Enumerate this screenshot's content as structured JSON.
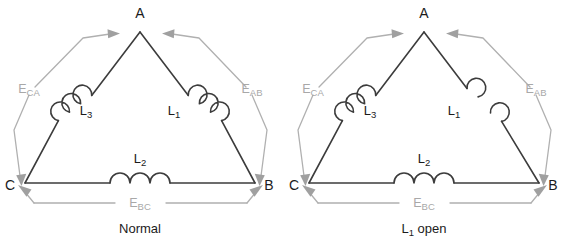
{
  "figure": {
    "background_color": "#ffffff",
    "line_color": "#3c3c3c",
    "annotation_color": "#a8a8a8",
    "text_color": "#1b1b1b"
  },
  "panels": [
    {
      "id": "normal",
      "caption": "Normal",
      "caption_sub": "",
      "caption_tail": "",
      "vertices": {
        "a": "A",
        "b": "B",
        "c": "C"
      },
      "coils": [
        {
          "name": "L",
          "sub": "1",
          "position": "right-leg",
          "state": "closed",
          "turns": 3
        },
        {
          "name": "L",
          "sub": "2",
          "position": "bottom",
          "state": "closed",
          "turns": 3
        },
        {
          "name": "L",
          "sub": "3",
          "position": "left-leg",
          "state": "closed",
          "turns": 3
        }
      ],
      "emf_labels": [
        {
          "name": "E",
          "sub": "CA",
          "side": "left"
        },
        {
          "name": "E",
          "sub": "AB",
          "side": "right"
        },
        {
          "name": "E",
          "sub": "BC",
          "side": "bottom"
        }
      ]
    },
    {
      "id": "l1-open",
      "caption": "L",
      "caption_sub": "1",
      "caption_tail": " open",
      "vertices": {
        "a": "A",
        "b": "B",
        "c": "C"
      },
      "coils": [
        {
          "name": "L",
          "sub": "1",
          "position": "right-leg",
          "state": "open",
          "turns": 2
        },
        {
          "name": "L",
          "sub": "2",
          "position": "bottom",
          "state": "closed",
          "turns": 3
        },
        {
          "name": "L",
          "sub": "3",
          "position": "left-leg",
          "state": "closed",
          "turns": 3
        }
      ],
      "emf_labels": [
        {
          "name": "E",
          "sub": "CA",
          "side": "left"
        },
        {
          "name": "E",
          "sub": "AB",
          "side": "right"
        },
        {
          "name": "E",
          "sub": "BC",
          "side": "bottom"
        }
      ]
    }
  ]
}
